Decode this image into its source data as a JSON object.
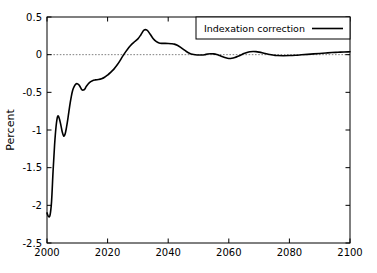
{
  "chart_data": {
    "type": "line",
    "title": "",
    "subtitle": "",
    "xlabel": "",
    "ylabel": "Percent",
    "xlim": [
      2000,
      2100
    ],
    "ylim": [
      -2.5,
      0.5
    ],
    "grid": false,
    "legend_position": "top-right-inside",
    "x_ticks": [
      2000,
      2020,
      2040,
      2060,
      2080,
      2100
    ],
    "x_tick_labels": [
      "2000",
      "2020",
      "2040",
      "2060",
      "2080",
      "2100"
    ],
    "y_ticks": [
      0.5,
      0,
      -0.5,
      -1,
      -1.5,
      -2,
      -2.5
    ],
    "y_tick_labels": [
      "0.5",
      "0",
      "-0.5",
      "-1",
      "-1.5",
      "-2",
      "-2.5"
    ],
    "reference_lines": [
      {
        "name": "zero-line",
        "axis": "y",
        "value": 0,
        "style": "dotted",
        "color": "#808080"
      }
    ],
    "legend": [
      {
        "name": "Indexation correction",
        "color": "#000000",
        "style": "solid"
      }
    ],
    "series": [
      {
        "name": "Indexation correction",
        "color": "#000000",
        "x": [
          2000,
          2000.5,
          2001,
          2001.5,
          2002,
          2002.5,
          2003,
          2003.5,
          2004,
          2004.5,
          2005,
          2005.5,
          2006,
          2006.5,
          2007,
          2007.5,
          2008,
          2008.5,
          2009,
          2009.5,
          2010,
          2010.5,
          2011,
          2011.5,
          2012,
          2012.5,
          2013,
          2014,
          2015,
          2016,
          2017,
          2018,
          2019,
          2020,
          2021,
          2022,
          2023,
          2024,
          2025,
          2026,
          2027,
          2028,
          2029,
          2030,
          2031,
          2032,
          2033,
          2034,
          2035,
          2036,
          2037,
          2038,
          2039,
          2040,
          2041,
          2042,
          2043,
          2044,
          2045,
          2046,
          2047,
          2048,
          2049,
          2050,
          2051,
          2052,
          2053,
          2054,
          2055,
          2056,
          2057,
          2058,
          2059,
          2060,
          2061,
          2062,
          2063,
          2064,
          2065,
          2066,
          2067,
          2068,
          2069,
          2070,
          2071,
          2072,
          2073,
          2074,
          2075,
          2076,
          2078,
          2080,
          2082,
          2084,
          2086,
          2088,
          2090,
          2092,
          2094,
          2096,
          2098,
          2100
        ],
        "y": [
          -2.1,
          -2.15,
          -2.13,
          -1.95,
          -1.55,
          -1.2,
          -0.95,
          -0.82,
          -0.84,
          -0.92,
          -1.02,
          -1.08,
          -1.05,
          -0.95,
          -0.82,
          -0.68,
          -0.56,
          -0.47,
          -0.42,
          -0.39,
          -0.385,
          -0.4,
          -0.43,
          -0.465,
          -0.47,
          -0.455,
          -0.42,
          -0.37,
          -0.345,
          -0.335,
          -0.33,
          -0.32,
          -0.3,
          -0.27,
          -0.235,
          -0.195,
          -0.145,
          -0.085,
          -0.02,
          0.04,
          0.095,
          0.14,
          0.175,
          0.21,
          0.265,
          0.325,
          0.325,
          0.275,
          0.215,
          0.175,
          0.155,
          0.15,
          0.15,
          0.148,
          0.145,
          0.14,
          0.125,
          0.1,
          0.07,
          0.042,
          0.02,
          0.005,
          -0.002,
          -0.005,
          -0.004,
          0.0,
          0.008,
          0.012,
          0.01,
          0.002,
          -0.012,
          -0.028,
          -0.042,
          -0.05,
          -0.048,
          -0.038,
          -0.022,
          -0.004,
          0.014,
          0.028,
          0.038,
          0.042,
          0.04,
          0.034,
          0.026,
          0.016,
          0.006,
          -0.002,
          -0.008,
          -0.012,
          -0.014,
          -0.012,
          -0.008,
          -0.002,
          0.004,
          0.01,
          0.016,
          0.022,
          0.028,
          0.032,
          0.036,
          0.038
        ]
      }
    ]
  },
  "axes": {
    "y_axis_title": "Percent"
  },
  "legend": {
    "entry_label": "Indexation correction"
  }
}
